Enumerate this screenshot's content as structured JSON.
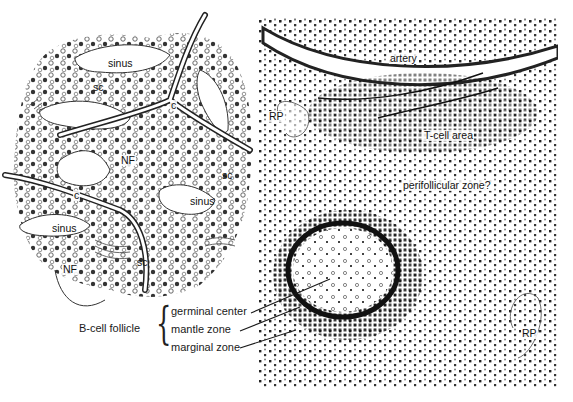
{
  "figure": {
    "type": "histology illustration"
  },
  "left_panel": {
    "labels": {
      "sinus_top": "sinus",
      "sc_top_left": "sc",
      "c_center": "c",
      "nf_center": "NF",
      "sc_right": "sc",
      "c_left": "c",
      "sinus_right": "sinus",
      "sinus_left": "sinus",
      "nf_bottom": "NF",
      "sc_bottom": "sc"
    }
  },
  "right_panel": {
    "labels": {
      "artery": "artery",
      "rp_top": "RP",
      "t_cell_area": "T-cell area",
      "perifollicular_zone": "perifollicular zone?",
      "rp_bottom": "RP"
    }
  },
  "legend": {
    "group_label": "B-cell follicle",
    "items": [
      {
        "label": "germinal center"
      },
      {
        "label": "mantle zone"
      },
      {
        "label": "marginal zone"
      }
    ]
  },
  "colors": {
    "ink": "#1a1a1a",
    "background": "#ffffff",
    "cell_dark": "#222222",
    "cell_mid": "#666666"
  }
}
